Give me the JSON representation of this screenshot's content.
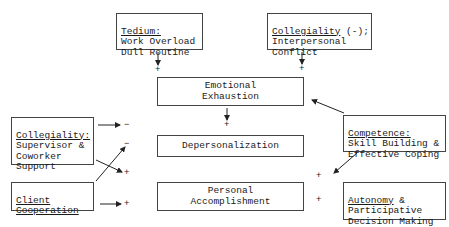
{
  "diagram": {
    "nodes": {
      "tedium": {
        "heading": "Tedium:",
        "lines": [
          "Work Overload",
          "Dull Routine"
        ]
      },
      "collegiality_neg": {
        "heading": "Collegiality",
        "heading_suffix": " (-);",
        "lines": [
          "Interpersonal",
          "Conflict"
        ]
      },
      "emotional_exhaustion": {
        "lines": [
          "Emotional",
          "Exhaustion"
        ]
      },
      "depersonalization": {
        "lines": [
          "Depersonalization"
        ]
      },
      "personal_accomplishment": {
        "lines": [
          "Personal",
          "Accomplishment"
        ]
      },
      "collegiality_support": {
        "heading": "Collegiality:",
        "lines": [
          "Supervisor &",
          "Coworker",
          "Support"
        ]
      },
      "client_cooperation": {
        "heading_lines": [
          "Client",
          "Cooperation"
        ]
      },
      "competence": {
        "heading": "Competence:",
        "lines": [
          "Skill Building &",
          "Effective Coping"
        ]
      },
      "autonomy": {
        "heading": "Autonomy",
        "heading_suffix": " &",
        "lines": [
          "Participative",
          "Decision Making"
        ]
      }
    },
    "edges": [
      {
        "from": "tedium",
        "to": "emotional_exhaustion",
        "sign": "+"
      },
      {
        "from": "collegiality_neg",
        "to": "emotional_exhaustion",
        "sign": "+"
      },
      {
        "from": "competence",
        "to": "emotional_exhaustion",
        "sign": ""
      },
      {
        "from": "emotional_exhaustion",
        "to": "depersonalization",
        "sign": "+"
      },
      {
        "from": "collegiality_support",
        "to": "depersonalization",
        "sign": "-"
      },
      {
        "from": "client_cooperation",
        "to": "depersonalization",
        "sign": "-"
      },
      {
        "from": "collegiality_support",
        "to": "personal_accomplishment",
        "sign": "+"
      },
      {
        "from": "client_cooperation",
        "to": "personal_accomplishment",
        "sign": "+"
      },
      {
        "from": "competence",
        "to": "personal_accomplishment",
        "sign": "+"
      },
      {
        "from": "autonomy",
        "to": "personal_accomplishment",
        "sign": "+"
      }
    ],
    "signs": {
      "tedium_ee": "+",
      "colneg_ee": "+",
      "ee_dp": "+",
      "colsup_dp": "−",
      "client_dp": "−",
      "colsup_pa": "+",
      "client_pa": "+",
      "competence_pa": "+",
      "autonomy_pa": "+"
    }
  }
}
